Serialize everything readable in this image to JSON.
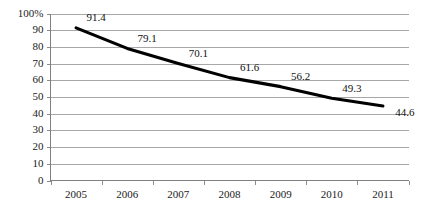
{
  "chart_data": {
    "type": "line",
    "title": "",
    "subtitle": "",
    "xlabel": "",
    "ylabel": "",
    "categories": [
      "2005",
      "2006",
      "2007",
      "2008",
      "2009",
      "2010",
      "2011"
    ],
    "values": [
      91.4,
      79.1,
      70.1,
      61.6,
      56.2,
      49.3,
      44.6
    ],
    "point_labels": [
      "91.4",
      "79.1",
      "70.1",
      "61.6",
      "56.2",
      "49.3",
      "44.6"
    ],
    "series": [
      {
        "name": "",
        "values": [
          91.4,
          79.1,
          70.1,
          61.6,
          56.2,
          49.3,
          44.6
        ],
        "color": "#000000"
      }
    ],
    "ylim": [
      0,
      100
    ],
    "ytick_values": [
      0,
      10,
      20,
      30,
      40,
      50,
      60,
      70,
      80,
      90,
      100
    ],
    "ytick_labels": [
      "0",
      "10",
      "20",
      "30",
      "40",
      "50",
      "60",
      "70",
      "80",
      "90",
      "100%"
    ],
    "grid": true,
    "grid_axis": "y",
    "legend": false,
    "legend_position": "none",
    "data_labels_visible": true,
    "colors": {
      "line": "#000000",
      "gridline": "#a8a8a8",
      "axis": "#808080",
      "text": "#1a1a1a",
      "background": "#ffffff"
    }
  }
}
